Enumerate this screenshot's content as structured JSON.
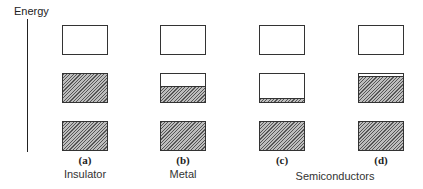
{
  "axis": {
    "label": "Energy"
  },
  "columns": [
    {
      "id": "a",
      "letter": "(a)",
      "caption": "Insulator",
      "bands": [
        {
          "fill": 0
        },
        {
          "fill": 1.0
        },
        {
          "fill": 1.0
        }
      ]
    },
    {
      "id": "b",
      "letter": "(b)",
      "caption": "Metal",
      "bands": [
        {
          "fill": 0
        },
        {
          "fill": 0.5
        },
        {
          "fill": 1.0
        }
      ]
    },
    {
      "id": "c",
      "letter": "(c)",
      "caption": "",
      "bands": [
        {
          "fill": 0
        },
        {
          "fill": 0.1
        },
        {
          "fill": 1.0
        }
      ]
    },
    {
      "id": "d",
      "letter": "(d)",
      "caption": "",
      "bands": [
        {
          "fill": 0
        },
        {
          "fill": 0.88
        },
        {
          "fill": 1.0
        }
      ]
    }
  ],
  "group_caption": "Semiconductors",
  "colors": {
    "line": "#333333",
    "hatch_bg": "#bdbdbd",
    "hatch_line": "#555555"
  }
}
